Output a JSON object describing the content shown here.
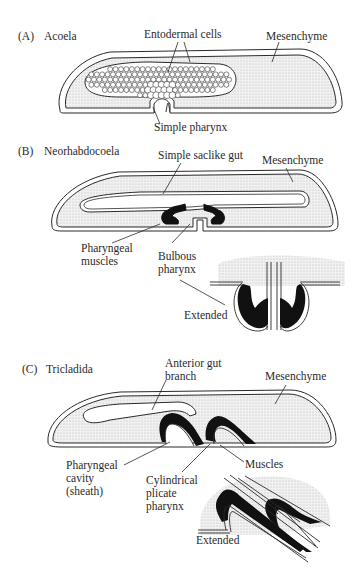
{
  "figure": {
    "panels": [
      {
        "id": "A",
        "letter": "(A)",
        "title": "Acoela",
        "labels": {
          "entodermal_cells": "Entodermal cells",
          "mesenchyme": "Mesenchyme",
          "simple_pharynx": "Simple pharynx"
        }
      },
      {
        "id": "B",
        "letter": "(B)",
        "title": "Neorhabdocoela",
        "labels": {
          "simple_saclike_gut": "Simple saclike gut",
          "mesenchyme": "Mesenchyme",
          "pharyngeal_muscles": "Pharyngeal\nmuscles",
          "bulbous_pharynx": "Bulbous\npharynx",
          "extended": "Extended"
        }
      },
      {
        "id": "C",
        "letter": "(C)",
        "title": "Tricladida",
        "labels": {
          "anterior_gut_branch": "Anterior gut\nbranch",
          "mesenchyme": "Mesenchyme",
          "pharyngeal_cavity": "Pharyngeal\ncavity\n(sheath)",
          "cylindrical_plicate_pharynx": "Cylindrical\nplicate\npharynx",
          "muscles": "Muscles",
          "extended": "Extended"
        }
      }
    ],
    "colors": {
      "stroke": "#2a2a2a",
      "stipple": "#e6e6e6",
      "muscle": "#111111",
      "background": "#ffffff"
    }
  }
}
